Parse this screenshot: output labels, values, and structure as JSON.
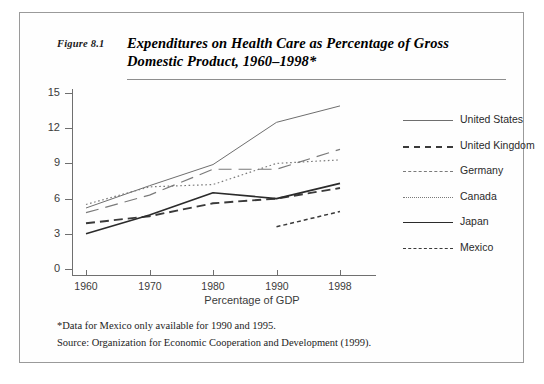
{
  "figure": {
    "number": "Figure 8.1",
    "title": "Expenditures on Health Care as Percentage of Gross Domestic Product, 1960–1998*"
  },
  "notes": {
    "footnote": "*Data for Mexico only available for 1990 and 1995.",
    "source": "Source: Organization for Economic Cooperation and Development (1999)."
  },
  "chart_data": {
    "type": "line",
    "title": "Expenditures on Health Care as Percentage of Gross Domestic Product, 1960–1998*",
    "xlabel": "Percentage of GDP",
    "ylabel": "",
    "categories": [
      "1960",
      "1970",
      "1980",
      "1990",
      "1998"
    ],
    "xtick_labels": [
      "1960",
      "1970",
      "1980",
      "1990",
      "1998"
    ],
    "ytick_labels": [
      "0",
      "3",
      "6",
      "9",
      "12",
      "15"
    ],
    "yticks": [
      0,
      3,
      6,
      9,
      12,
      15
    ],
    "ylim": [
      0,
      15
    ],
    "grid": false,
    "legend_position": "right",
    "series": [
      {
        "name": "United States",
        "style": "solid-thin",
        "color": "#6e6e6e",
        "x": [
          "1960",
          "1970",
          "1980",
          "1990",
          "1998"
        ],
        "values": [
          5.2,
          7.1,
          8.9,
          12.5,
          13.9
        ]
      },
      {
        "name": "United Kingdom",
        "style": "dash-long",
        "color": "#3a3a3a",
        "x": [
          "1960",
          "1970",
          "1980",
          "1990",
          "1998"
        ],
        "values": [
          3.9,
          4.5,
          5.6,
          6.0,
          6.9
        ]
      },
      {
        "name": "Germany",
        "style": "dash-wide",
        "color": "#7a7a7a",
        "x": [
          "1960",
          "1970",
          "1980",
          "1990",
          "1998"
        ],
        "values": [
          4.8,
          6.3,
          8.5,
          8.5,
          10.2
        ]
      },
      {
        "name": "Canada",
        "style": "dotted",
        "color": "#7a7a7a",
        "x": [
          "1960",
          "1970",
          "1980",
          "1990",
          "1998"
        ],
        "values": [
          5.5,
          7.0,
          7.2,
          9.0,
          9.3
        ]
      },
      {
        "name": "Japan",
        "style": "solid-bold",
        "color": "#2b2b2b",
        "x": [
          "1960",
          "1970",
          "1980",
          "1990",
          "1998"
        ],
        "values": [
          3.0,
          4.6,
          6.5,
          6.0,
          7.3
        ]
      },
      {
        "name": "Mexico",
        "style": "dash-short",
        "color": "#3a3a3a",
        "x": [
          "1990",
          "1998"
        ],
        "values": [
          3.6,
          4.9
        ]
      }
    ]
  }
}
